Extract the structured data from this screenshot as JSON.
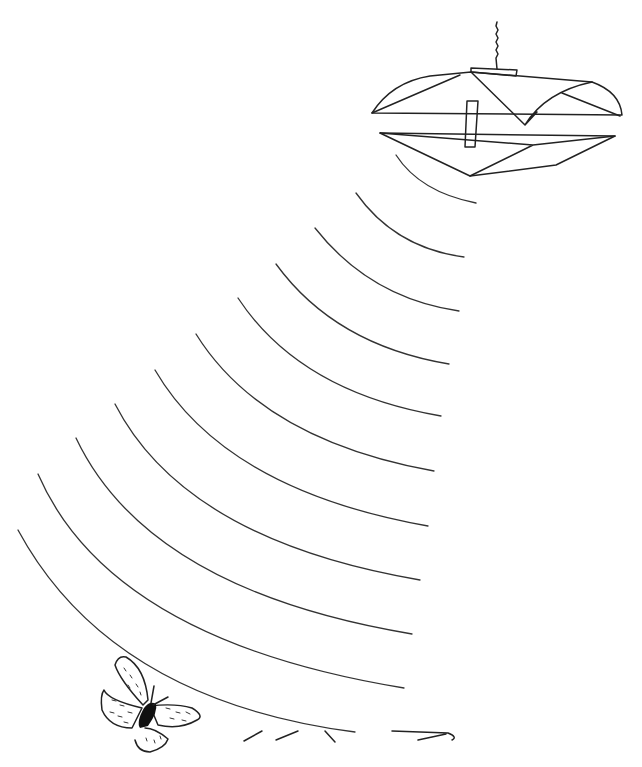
{
  "illustration": {
    "subject": "pheromone trap emitting scent waves toward a butterfly",
    "elements": [
      "hanging-trap",
      "scent-waves",
      "butterfly",
      "ground-strokes"
    ],
    "wave_count": 11,
    "stroke_color": "#222222",
    "background_color": "#ffffff"
  }
}
